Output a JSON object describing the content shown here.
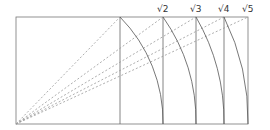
{
  "diagram": {
    "origin": [
      16,
      124
    ],
    "unit": 104,
    "height": 107,
    "labels": [
      "√2",
      "√3",
      "√4",
      "√5"
    ],
    "colors": {
      "line": "#555555",
      "dashed": "#999999",
      "label": "#333333"
    }
  }
}
